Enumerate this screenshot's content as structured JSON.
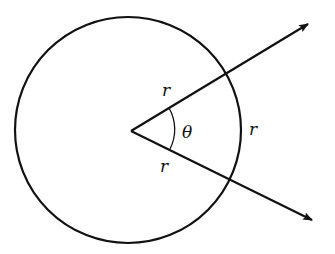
{
  "diagram": {
    "labels": {
      "radius_upper": "r",
      "radius_lower": "r",
      "arc": "r",
      "angle": "θ"
    },
    "colors": {
      "stroke": "#111111",
      "background": "#ffffff"
    }
  }
}
